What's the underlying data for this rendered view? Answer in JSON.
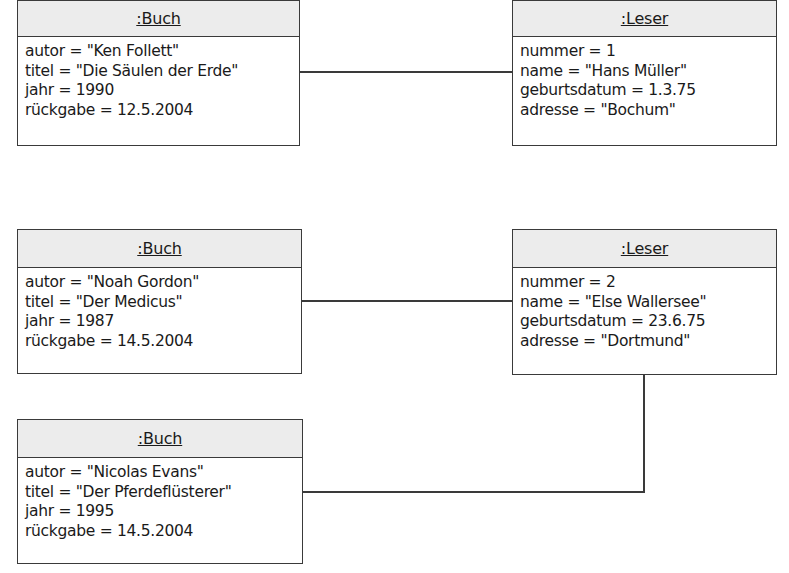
{
  "diagram": {
    "type": "UML object diagram",
    "objects": [
      {
        "id": "buch1",
        "name": ":Buch",
        "attributes": [
          "autor = \"Ken Follett\"",
          "titel = \"Die Säulen der Erde\"",
          "jahr = 1990",
          "rückgabe = 12.5.2004"
        ]
      },
      {
        "id": "leser1",
        "name": ":Leser",
        "attributes": [
          "nummer = 1",
          "name = \"Hans Müller\"",
          "geburtsdatum = 1.3.75",
          "adresse = \"Bochum\""
        ]
      },
      {
        "id": "buch2",
        "name": ":Buch",
        "attributes": [
          "autor = \"Noah Gordon\"",
          "titel = \"Der Medicus\"",
          "jahr = 1987",
          "rückgabe = 14.5.2004"
        ]
      },
      {
        "id": "leser2",
        "name": ":Leser",
        "attributes": [
          "nummer = 2",
          "name = \"Else Wallersee\"",
          "geburtsdatum = 23.6.75",
          "adresse = \"Dortmund\""
        ]
      },
      {
        "id": "buch3",
        "name": ":Buch",
        "attributes": [
          "autor = \"Nicolas Evans\"",
          "titel = \"Der Pferdeflüsterer\"",
          "jahr = 1995",
          "rückgabe = 14.5.2004"
        ]
      }
    ],
    "links": [
      {
        "from": "buch1",
        "to": "leser1"
      },
      {
        "from": "buch2",
        "to": "leser2"
      },
      {
        "from": "buch3",
        "to": "leser2"
      }
    ],
    "colors": {
      "line": "#3a3a3a",
      "header_fill": "#ececec",
      "body_fill": "#ffffff"
    }
  }
}
